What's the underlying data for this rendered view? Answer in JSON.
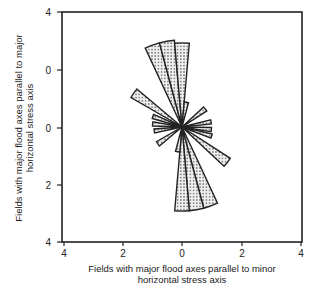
{
  "chart_data": {
    "type": "rose",
    "title": "",
    "xlabel": [
      "Fields with major flood axes parallel to minor",
      "horizontal stress axis"
    ],
    "ylabel": [
      "Fields with major flood axes parallel to major",
      "horizontal stress axis"
    ],
    "xlim": [
      -4,
      4
    ],
    "ylim": [
      -4,
      4
    ],
    "x_ticks": [
      "4",
      "2",
      "0",
      "2",
      "4"
    ],
    "y_ticks": [
      "4",
      "0",
      "0",
      "2",
      "4"
    ],
    "grid": false,
    "legend": null,
    "fill_pattern": "stippled",
    "colors": {
      "outline": "#222222",
      "fill": "#e8e8e8",
      "dots": "#555555"
    },
    "petals": [
      {
        "azimuth_deg": -20,
        "width_deg": 10,
        "value": 2.95
      },
      {
        "azimuth_deg": -10,
        "width_deg": 10,
        "value": 2.95
      },
      {
        "azimuth_deg": 0,
        "width_deg": 10,
        "value": 2.85
      },
      {
        "azimuth_deg": 10,
        "width_deg": 10,
        "value": 0.85
      },
      {
        "azimuth_deg": -55,
        "width_deg": 10,
        "value": 2.0
      },
      {
        "azimuth_deg": -70,
        "width_deg": 8,
        "value": 1.05
      },
      {
        "azimuth_deg": -84,
        "width_deg": 8,
        "value": 1.0
      },
      {
        "azimuth_deg": -98,
        "width_deg": 8,
        "value": 0.95
      },
      {
        "azimuth_deg": -125,
        "width_deg": 10,
        "value": 1.0
      },
      {
        "azimuth_deg": 52,
        "width_deg": 10,
        "value": 1.0
      },
      {
        "azimuth_deg": 80,
        "width_deg": 8,
        "value": 1.0
      },
      {
        "azimuth_deg": 95,
        "width_deg": 8,
        "value": 1.0
      },
      {
        "azimuth_deg": 107,
        "width_deg": 8,
        "value": 1.05
      },
      {
        "azimuth_deg": 128,
        "width_deg": 10,
        "value": 1.95
      },
      {
        "azimuth_deg": 160,
        "width_deg": 10,
        "value": 2.85
      },
      {
        "azimuth_deg": 170,
        "width_deg": 10,
        "value": 2.85
      },
      {
        "azimuth_deg": 180,
        "width_deg": 10,
        "value": 2.85
      },
      {
        "azimuth_deg": 190,
        "width_deg": 10,
        "value": 0.85
      }
    ]
  }
}
